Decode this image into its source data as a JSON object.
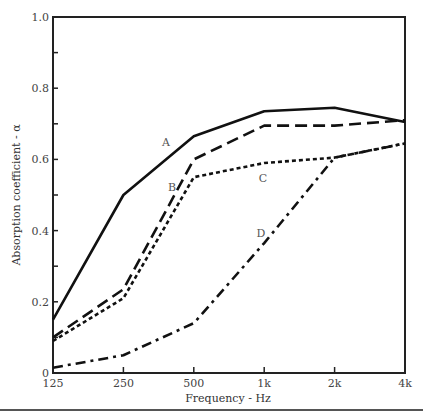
{
  "chart_data": {
    "type": "line",
    "title": "",
    "xlabel": "Frequency - Hz",
    "ylabel": "Absorption coefficient - α",
    "x": [
      "125",
      "250",
      "500",
      "1k",
      "2k",
      "4k"
    ],
    "x_scale": "log2",
    "ylim": [
      0,
      1.0
    ],
    "y_ticks": [
      "0",
      "0.2",
      "0.4",
      "0.6",
      "0.8",
      "1.0"
    ],
    "y_minor_ticks": [
      0.1,
      0.3,
      0.5,
      0.7,
      0.9
    ],
    "grid": false,
    "legend": "inline labels",
    "series": [
      {
        "name": "A",
        "style": "solid",
        "values": [
          0.15,
          0.5,
          0.665,
          0.735,
          0.745,
          0.705
        ],
        "label_pos": [
          166,
          146
        ]
      },
      {
        "name": "B",
        "style": "long-dash",
        "values": [
          0.1,
          0.235,
          0.6,
          0.695,
          0.695,
          0.71
        ],
        "label_pos": [
          172,
          191
        ]
      },
      {
        "name": "C",
        "style": "short-dash",
        "values": [
          0.09,
          0.21,
          0.55,
          0.59,
          0.605,
          0.645
        ],
        "label_pos": [
          263,
          182
        ]
      },
      {
        "name": "D",
        "style": "dash-dot",
        "values": [
          0.015,
          0.05,
          0.14,
          0.365,
          0.605,
          0.645
        ],
        "label_pos": [
          261,
          237
        ]
      }
    ]
  }
}
